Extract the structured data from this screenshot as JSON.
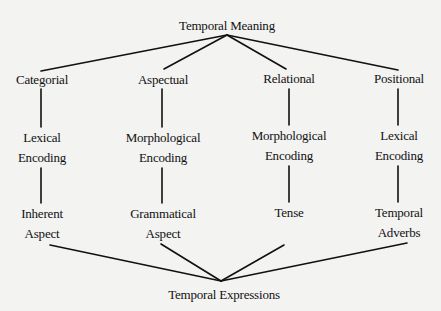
{
  "diagram": {
    "title": "Temporal Meaning",
    "root": {
      "label": "Temporal Meaning",
      "x": 227,
      "y": 26,
      "anchor": {
        "x": 227,
        "y": 35
      }
    },
    "sink": {
      "label": "Temporal Expressions",
      "x": 224,
      "y": 295,
      "anchor": {
        "x": 221,
        "y": 281
      }
    },
    "columns": [
      {
        "category": {
          "label": "Categorial",
          "x": 42,
          "y": 80
        },
        "encoding": {
          "line1": "Lexical",
          "line2": "Encoding",
          "x": 42,
          "y": 148
        },
        "form": {
          "line1": "Inherent",
          "line2": "Aspect",
          "x": 42,
          "y": 224
        }
      },
      {
        "category": {
          "label": "Aspectual",
          "x": 163,
          "y": 80
        },
        "encoding": {
          "line1": "Morphological",
          "line2": "Encoding",
          "x": 163,
          "y": 148
        },
        "form": {
          "line1": "Grammatical",
          "line2": "Aspect",
          "x": 163,
          "y": 224
        }
      },
      {
        "category": {
          "label": "Relational",
          "x": 289,
          "y": 79
        },
        "encoding": {
          "line1": "Morphological",
          "line2": "Encoding",
          "x": 289,
          "y": 146
        },
        "form": {
          "line1": "Tense",
          "line2": "",
          "x": 289,
          "y": 213
        }
      },
      {
        "category": {
          "label": "Positional",
          "x": 399,
          "y": 79
        },
        "encoding": {
          "line1": "Lexical",
          "line2": "Encoding",
          "x": 399,
          "y": 146
        },
        "form": {
          "line1": "Temporal",
          "line2": "Adverbs",
          "x": 399,
          "y": 223
        }
      }
    ],
    "edges": [
      {
        "from": "Temporal Meaning",
        "to": "Categorial",
        "x1": 227,
        "y1": 35,
        "x2": 41,
        "y2": 71
      },
      {
        "from": "Temporal Meaning",
        "to": "Aspectual",
        "x1": 227,
        "y1": 35,
        "x2": 164,
        "y2": 69
      },
      {
        "from": "Temporal Meaning",
        "to": "Relational",
        "x1": 227,
        "y1": 35,
        "x2": 286,
        "y2": 69
      },
      {
        "from": "Temporal Meaning",
        "to": "Positional",
        "x1": 227,
        "y1": 35,
        "x2": 398,
        "y2": 70
      },
      {
        "from": "Categorial",
        "to": "Lexical Encoding",
        "x1": 41,
        "y1": 89,
        "x2": 41,
        "y2": 127
      },
      {
        "from": "Aspectual",
        "to": "Morphological Encoding",
        "x1": 162,
        "y1": 89,
        "x2": 162,
        "y2": 127
      },
      {
        "from": "Relational",
        "to": "Morphological Encoding",
        "x1": 289,
        "y1": 89,
        "x2": 289,
        "y2": 125
      },
      {
        "from": "Positional",
        "to": "Lexical Encoding",
        "x1": 398,
        "y1": 89,
        "x2": 398,
        "y2": 125
      },
      {
        "from": "Lexical Encoding",
        "to": "Inherent Aspect",
        "x1": 41,
        "y1": 168,
        "x2": 41,
        "y2": 203
      },
      {
        "from": "Morphological Encoding",
        "to": "Grammatical Aspect",
        "x1": 162,
        "y1": 168,
        "x2": 162,
        "y2": 203
      },
      {
        "from": "Morphological Encoding",
        "to": "Tense",
        "x1": 289,
        "y1": 166,
        "x2": 289,
        "y2": 202
      },
      {
        "from": "Lexical Encoding",
        "to": "Temporal Adverbs",
        "x1": 398,
        "y1": 166,
        "x2": 398,
        "y2": 202
      },
      {
        "from": "Inherent Aspect",
        "to": "Temporal Expressions",
        "x1": 50,
        "y1": 245,
        "x2": 221,
        "y2": 281
      },
      {
        "from": "Grammatical Aspect",
        "to": "Temporal Expressions",
        "x1": 161,
        "y1": 244,
        "x2": 221,
        "y2": 281
      },
      {
        "from": "Tense",
        "to": "Temporal Expressions",
        "x1": 284,
        "y1": 245,
        "x2": 221,
        "y2": 281
      },
      {
        "from": "Temporal Adverbs",
        "to": "Temporal Expressions",
        "x1": 407,
        "y1": 243,
        "x2": 221,
        "y2": 281
      }
    ],
    "colors": {
      "background": "#f3f3f2",
      "ink": "#111111"
    }
  }
}
